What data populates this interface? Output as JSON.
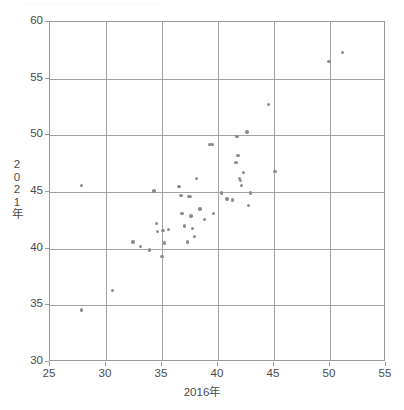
{
  "chart_data": {
    "type": "scatter",
    "title": "",
    "xlabel": "2016年",
    "ylabel": "2021年",
    "xlim": [
      25,
      55
    ],
    "ylim": [
      30,
      60
    ],
    "xticks": [
      25,
      30,
      35,
      40,
      45,
      50,
      55
    ],
    "yticks": [
      30,
      35,
      40,
      45,
      50,
      55,
      60
    ],
    "grid": true,
    "legend": null,
    "point_color": "#8d8d8d",
    "axis_color": "#9a9a9a",
    "series": [
      {
        "name": "都道府県",
        "points": [
          [
            27.8,
            45.6
          ],
          [
            27.8,
            34.6
          ],
          [
            30.6,
            36.3
          ],
          [
            32.4,
            40.6
          ],
          [
            33.1,
            40.2
          ],
          [
            33.9,
            39.9
          ],
          [
            34.3,
            45.1
          ],
          [
            34.5,
            42.2
          ],
          [
            34.6,
            41.5
          ],
          [
            35.0,
            39.3
          ],
          [
            35.1,
            41.6
          ],
          [
            35.2,
            40.5
          ],
          [
            35.6,
            41.7
          ],
          [
            36.5,
            45.5
          ],
          [
            36.7,
            44.7
          ],
          [
            36.8,
            43.1
          ],
          [
            37.0,
            42.0
          ],
          [
            37.3,
            40.6
          ],
          [
            37.4,
            44.6
          ],
          [
            37.5,
            44.6
          ],
          [
            37.6,
            42.9
          ],
          [
            37.7,
            41.8
          ],
          [
            37.9,
            41.1
          ],
          [
            38.1,
            46.2
          ],
          [
            38.4,
            43.5
          ],
          [
            38.8,
            42.6
          ],
          [
            39.3,
            49.2
          ],
          [
            39.5,
            49.2
          ],
          [
            39.6,
            43.1
          ],
          [
            40.3,
            44.9
          ],
          [
            40.8,
            44.4
          ],
          [
            41.3,
            44.3
          ],
          [
            41.6,
            47.6
          ],
          [
            41.7,
            49.9
          ],
          [
            41.8,
            48.2
          ],
          [
            41.9,
            46.2
          ],
          [
            42.0,
            46.0
          ],
          [
            42.1,
            45.6
          ],
          [
            42.3,
            46.7
          ],
          [
            42.6,
            50.3
          ],
          [
            42.7,
            43.8
          ],
          [
            42.9,
            44.9
          ],
          [
            44.5,
            52.7
          ],
          [
            45.1,
            46.8
          ],
          [
            49.9,
            56.5
          ],
          [
            51.1,
            57.3
          ]
        ]
      }
    ]
  },
  "axis": {
    "x_title": "2016年",
    "y_title_chars": [
      "2",
      "0",
      "2",
      "1",
      "年"
    ]
  }
}
